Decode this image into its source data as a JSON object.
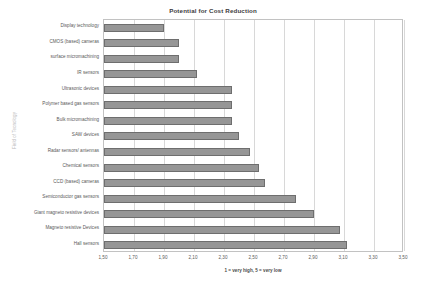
{
  "chart_data": {
    "type": "bar",
    "orientation": "horizontal",
    "title": "Potential for Cost Reduction",
    "xlabel": "1 = very high, 5 = very low",
    "ylabel": "Field of Tecnology",
    "xlim": [
      1.5,
      3.5
    ],
    "xticks": [
      "1,50",
      "1,70",
      "1,90",
      "2,10",
      "2,30",
      "2,50",
      "2,70",
      "2,90",
      "3,10",
      "3,30",
      "3,50"
    ],
    "xtick_values": [
      1.5,
      1.7,
      1.9,
      2.1,
      2.3,
      2.5,
      2.7,
      2.9,
      3.1,
      3.3,
      3.5
    ],
    "grid": true,
    "legend": "none",
    "bar_color": "#969696",
    "bar_edge_color": "#6e6e6e",
    "categories": [
      "Display technology",
      "CMOS (based) cameras",
      "surface micromachining",
      "IR sensors",
      "Ultrasonic devices",
      "Polymer based gas sensors",
      "Bulk micromachining",
      "SAW devices",
      "Radar sensors/ antennas",
      "Chemical sensors",
      "CCD (based) cameras",
      "Semiconductor gas sensors",
      "Giant magneto resistive devices",
      "Magneto resistive Devices",
      "Hall sensors"
    ],
    "values": [
      1.9,
      2.0,
      2.0,
      2.12,
      2.35,
      2.35,
      2.35,
      2.4,
      2.47,
      2.53,
      2.57,
      2.78,
      2.9,
      3.07,
      3.12
    ]
  }
}
